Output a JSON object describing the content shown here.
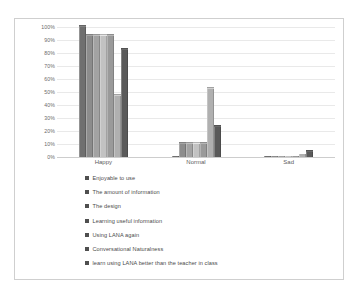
{
  "chart_data": {
    "type": "bar",
    "title": "",
    "subtitle": "",
    "xlabel": "",
    "ylabel": "",
    "ylim": [
      0,
      100
    ],
    "ytick_labels": [
      "100%",
      "90%",
      "80%",
      "70%",
      "60%",
      "50%",
      "40%",
      "30%",
      "20%",
      "10%",
      "0%"
    ],
    "ytick_values": [
      100,
      90,
      80,
      70,
      60,
      50,
      40,
      30,
      20,
      10,
      0
    ],
    "grid": true,
    "legend_position": "bottom-left",
    "categories": [
      "Happy",
      "Normal",
      "Sad"
    ],
    "series": [
      {
        "name": "Enjoyable to use",
        "color": "#6f6f6f",
        "values": [
          100,
          0,
          0
        ]
      },
      {
        "name": "The amount of information",
        "color": "#8c8c8c",
        "values": [
          93,
          10,
          0
        ]
      },
      {
        "name": "The design",
        "color": "#a3a3a3",
        "values": [
          93,
          10,
          0
        ]
      },
      {
        "name": "Learning useful information",
        "color": "#c2c2c2",
        "values": [
          93,
          10,
          0
        ]
      },
      {
        "name": "Using LANA again",
        "color": "#9a9a9a",
        "values": [
          93,
          10,
          0
        ]
      },
      {
        "name": "Conversational Naturalness",
        "color": "#b0b0b0",
        "values": [
          47,
          52,
          2
        ]
      },
      {
        "name": "learn using LANA better than the teacher in class",
        "color": "#5a5a5a",
        "values": [
          82,
          23,
          4
        ]
      }
    ]
  },
  "legend": {
    "marker_color": "#4f4f4f",
    "items": [
      "Enjoyable to use",
      "The amount of information",
      "The design",
      "Learning useful information",
      "Using LANA again",
      "Conversational Naturalness",
      "learn using LANA better than the teacher in class"
    ]
  }
}
